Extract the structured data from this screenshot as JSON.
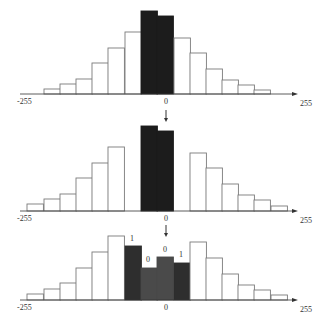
{
  "colors": {
    "background": "#ffffff",
    "outline": "#7a7a7a",
    "axis": "#333333",
    "white_bar": "#ffffff",
    "dark_bar": "#1c1c1c",
    "embed_dark": "#2e2e2e",
    "embed_gray": "#4a4a4a",
    "text": "#333333"
  },
  "panels": [
    {
      "id": "original",
      "axis": {
        "left_label": "-255",
        "center_label": "0",
        "right_label": "255"
      },
      "baseline_y": 94,
      "bars": [
        {
          "x": 44,
          "top": 89,
          "style": "white"
        },
        {
          "x": 60,
          "top": 84,
          "style": "white"
        },
        {
          "x": 76,
          "top": 79,
          "style": "white"
        },
        {
          "x": 92,
          "top": 63,
          "style": "white"
        },
        {
          "x": 108,
          "top": 48,
          "style": "white"
        },
        {
          "x": 125,
          "top": 32,
          "style": "white"
        },
        {
          "x": 141,
          "top": 11,
          "style": "dark"
        },
        {
          "x": 157,
          "top": 16,
          "style": "dark"
        },
        {
          "x": 174,
          "top": 38,
          "style": "white"
        },
        {
          "x": 190,
          "top": 53,
          "style": "white"
        },
        {
          "x": 206,
          "top": 69,
          "style": "white"
        },
        {
          "x": 222,
          "top": 80,
          "style": "white"
        },
        {
          "x": 238,
          "top": 85,
          "style": "white"
        },
        {
          "x": 254,
          "top": 90,
          "style": "white"
        }
      ],
      "marks": []
    },
    {
      "id": "shifted",
      "axis": {
        "left_label": "-255",
        "center_label": "0",
        "right_label": "255"
      },
      "baseline_y": 211,
      "bars": [
        {
          "x": 27,
          "top": 204,
          "style": "white"
        },
        {
          "x": 44,
          "top": 199,
          "style": "white"
        },
        {
          "x": 60,
          "top": 194,
          "style": "white"
        },
        {
          "x": 76,
          "top": 178,
          "style": "white"
        },
        {
          "x": 92,
          "top": 163,
          "style": "white"
        },
        {
          "x": 108,
          "top": 147,
          "style": "white"
        },
        {
          "x": 141,
          "top": 126,
          "style": "dark"
        },
        {
          "x": 157,
          "top": 131,
          "style": "dark"
        },
        {
          "x": 190,
          "top": 153,
          "style": "white"
        },
        {
          "x": 206,
          "top": 168,
          "style": "white"
        },
        {
          "x": 222,
          "top": 184,
          "style": "white"
        },
        {
          "x": 238,
          "top": 195,
          "style": "white"
        },
        {
          "x": 254,
          "top": 200,
          "style": "white"
        },
        {
          "x": 271,
          "top": 206,
          "style": "white"
        }
      ],
      "marks": []
    },
    {
      "id": "embedded",
      "axis": {
        "left_label": "-255",
        "center_label": "0",
        "right_label": "255"
      },
      "baseline_y": 300,
      "bars": [
        {
          "x": 27,
          "top": 294,
          "style": "white"
        },
        {
          "x": 44,
          "top": 289,
          "style": "white"
        },
        {
          "x": 60,
          "top": 283,
          "style": "white"
        },
        {
          "x": 76,
          "top": 268,
          "style": "white"
        },
        {
          "x": 92,
          "top": 252,
          "style": "white"
        },
        {
          "x": 108,
          "top": 236,
          "style": "white"
        },
        {
          "x": 125,
          "top": 246,
          "style": "embed_dark"
        },
        {
          "x": 141,
          "top": 268,
          "style": "embed_gray"
        },
        {
          "x": 157,
          "top": 257,
          "style": "embed_gray"
        },
        {
          "x": 174,
          "top": 263,
          "style": "embed_dark"
        },
        {
          "x": 190,
          "top": 242,
          "style": "white"
        },
        {
          "x": 206,
          "top": 258,
          "style": "white"
        },
        {
          "x": 222,
          "top": 274,
          "style": "white"
        },
        {
          "x": 238,
          "top": 285,
          "style": "white"
        },
        {
          "x": 254,
          "top": 290,
          "style": "white"
        },
        {
          "x": 271,
          "top": 295,
          "style": "white"
        }
      ],
      "marks": [
        {
          "x": 132,
          "y": 241,
          "text": "1"
        },
        {
          "x": 148,
          "y": 262,
          "text": "0"
        },
        {
          "x": 165,
          "y": 252,
          "text": "0"
        },
        {
          "x": 181,
          "y": 257,
          "text": "1"
        }
      ]
    }
  ],
  "arrows": [
    {
      "x": 166,
      "y1": 110,
      "y2": 122
    },
    {
      "x": 166,
      "y1": 225,
      "y2": 237
    }
  ],
  "bin_width": 16.4
}
